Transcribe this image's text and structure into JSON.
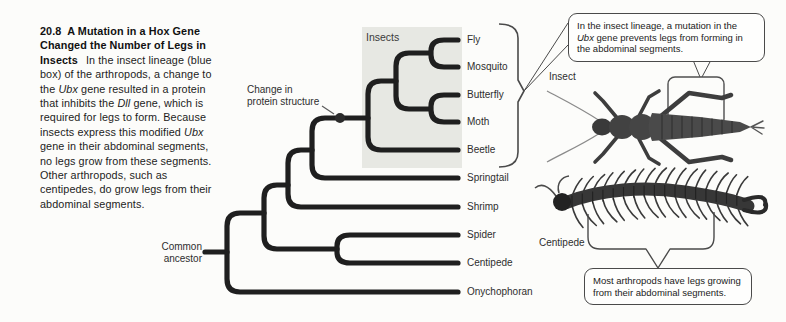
{
  "caption": {
    "number": "20.8",
    "title_rest": "A Mutation in a Hox Gene Changed the Number of Legs in Insects",
    "body_1": "In the insect lineage (blue box) of the arthropods, a change to the ",
    "gene_1": "Ubx",
    "body_2": " gene resulted in a protein that inhibits the ",
    "gene_2": "Dll",
    "body_3": " gene, which is required for legs to form. Because insects express this modified ",
    "gene_3": "Ubx",
    "body_4": " gene in their abdominal segments, no legs grow from these segments. Other arthro­pods, such as centipedes, do grow legs from their abdominal segments."
  },
  "tree": {
    "clade_box_label": "Insects",
    "root_label_line1": "Common",
    "root_label_line2": "ancestor",
    "mutation_label_line1": "Change in",
    "mutation_label_line2": "protein structure",
    "tips": [
      "Fly",
      "Mosquito",
      "Butterfly",
      "Moth",
      "Beetle",
      "Springtail",
      "Shrimp",
      "Spider",
      "Centipede",
      "Onychophoran"
    ],
    "topology_newick": "((((((((Fly,Mosquito),(Butterfly,Moth)),Beetle),Springtail),Shrimp),(Spider,Centipede)),Onychophoran)",
    "clade_box_color": "#e7e8e3",
    "branch_color": "#1f1f1f"
  },
  "callouts": {
    "insect_line1": "In the insect lineage, a mutation in the",
    "insect_gene": "Ubx",
    "insect_line2_rest": " gene prevents legs from forming in",
    "insect_line3": "the abdominal segments.",
    "centipede_line1": "Most arthropods have legs growing",
    "centipede_line2": "from their abdominal segments."
  },
  "specimens": {
    "insect_label": "Insect",
    "centipede_label": "Centipede"
  }
}
